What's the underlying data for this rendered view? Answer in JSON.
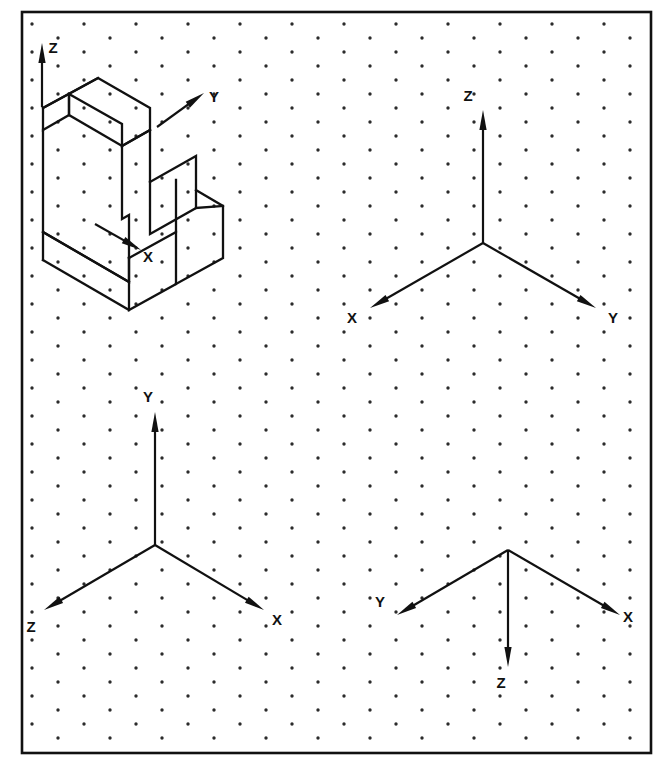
{
  "figure": {
    "background_color": "#ffffff",
    "ink_color": "#111111",
    "dot_color": "#2b2b2b",
    "frame": {
      "x": 22,
      "y": 12,
      "width": 629,
      "height": 741,
      "stroke_width": 2.6
    },
    "grid": {
      "type": "isometric-dot-grid",
      "col_spacing": 52,
      "row_spacing": 28,
      "stagger_x": 26,
      "stagger_y": 14,
      "dot_radius": 1.7
    },
    "panels": [
      {
        "id": "panel-object",
        "name": "isometric-stepped-block",
        "description": "Stepped solid block drawn in isometric projection with X, Y, Z axis indicator arrows",
        "origin": {
          "x": 98,
          "y": 78
        },
        "axes": [
          {
            "label": "Z",
            "direction": "up",
            "label_x": 53,
            "label_y": 53,
            "tail_x": 42,
            "tail_y": 107,
            "tip_x": 42,
            "tip_y": 43
          },
          {
            "label": "Y",
            "direction": "upper-right",
            "label_x": 214,
            "label_y": 102,
            "tail_x": 157,
            "tail_y": 127,
            "tip_x": 204,
            "tip_y": 93
          },
          {
            "label": "X",
            "direction": "lower-right",
            "label_x": 148,
            "label_y": 262,
            "tail_x": 95,
            "tail_y": 224,
            "tip_x": 141,
            "tip_y": 250
          }
        ]
      },
      {
        "id": "panel-top-right",
        "name": "axis-triad-z-up",
        "description": "Standard isometric triad: Z up, X to lower-left, Y to lower-right",
        "origin": {
          "x": 483,
          "y": 243
        },
        "axes": [
          {
            "label": "Z",
            "direction": "up",
            "label_x": 468,
            "label_y": 101,
            "tail_x": 483,
            "tail_y": 243,
            "tip_x": 483,
            "tip_y": 110
          },
          {
            "label": "X",
            "direction": "lower-left",
            "label_x": 352,
            "label_y": 323,
            "tail_x": 483,
            "tail_y": 243,
            "tip_x": 370,
            "tip_y": 308
          },
          {
            "label": "Y",
            "direction": "lower-right",
            "label_x": 613,
            "label_y": 323,
            "tail_x": 483,
            "tail_y": 243,
            "tip_x": 596,
            "tip_y": 308
          }
        ]
      },
      {
        "id": "panel-bottom-left",
        "name": "axis-triad-y-up",
        "description": "Isometric triad: Y up, Z to lower-left, X to lower-right",
        "origin": {
          "x": 155,
          "y": 545
        },
        "axes": [
          {
            "label": "Y",
            "direction": "up",
            "label_x": 148,
            "label_y": 402,
            "tail_x": 155,
            "tail_y": 545,
            "tip_x": 155,
            "tip_y": 412
          },
          {
            "label": "Z",
            "direction": "lower-left",
            "label_x": 31,
            "label_y": 632,
            "tail_x": 155,
            "tail_y": 545,
            "tip_x": 44,
            "tip_y": 610
          },
          {
            "label": "X",
            "direction": "lower-right",
            "label_x": 277,
            "label_y": 625,
            "tail_x": 155,
            "tail_y": 545,
            "tip_x": 264,
            "tip_y": 610
          }
        ]
      },
      {
        "id": "panel-bottom-right",
        "name": "axis-triad-z-down",
        "description": "Inverted triad: Z straight down, Y to lower-left, X to lower-right",
        "origin": {
          "x": 508,
          "y": 550
        },
        "axes": [
          {
            "label": "Z",
            "direction": "down",
            "label_x": 501,
            "label_y": 688,
            "tail_x": 508,
            "tail_y": 550,
            "tip_x": 508,
            "tip_y": 667
          },
          {
            "label": "Y",
            "direction": "lower-left",
            "label_x": 380,
            "label_y": 607,
            "tail_x": 508,
            "tail_y": 550,
            "tip_x": 397,
            "tip_y": 615
          },
          {
            "label": "X",
            "direction": "lower-right",
            "label_x": 628,
            "label_y": 622,
            "tail_x": 508,
            "tail_y": 550,
            "tip_x": 620,
            "tip_y": 615
          }
        ]
      }
    ],
    "solid": {
      "name": "stepped-block",
      "projection": "isometric",
      "edge_stroke_width": 2.3,
      "paths": [
        "M 98 78 L 150 108 L 150 130 L 122 146 L 122 124 L 69 94 L 69 115 L 43 130 L 43 108 Z",
        "M 43 108 L 98 78",
        "M 43 130 L 43 232 L 129 282 L 129 258",
        "M 129 258 L 129 215 L 122 219 L 122 146",
        "M 122 146 L 150 130",
        "M 150 130 L 150 182",
        "M 150 182 L 196 156 L 196 208 L 150 234 L 150 182",
        "M 129 258 L 176 232 L 176 180",
        "M 176 232 L 176 284 L 129 310 L 129 258",
        "M 176 284 L 223 258 L 223 206 L 196 190",
        "M 196 208 L 223 206",
        "M 69 115 L 122 146",
        "M 69 94 L 69 115",
        "M 43 232 L 129 282",
        "M 129 310 L 43 260",
        "M 43 232 L 43 260"
      ]
    }
  }
}
